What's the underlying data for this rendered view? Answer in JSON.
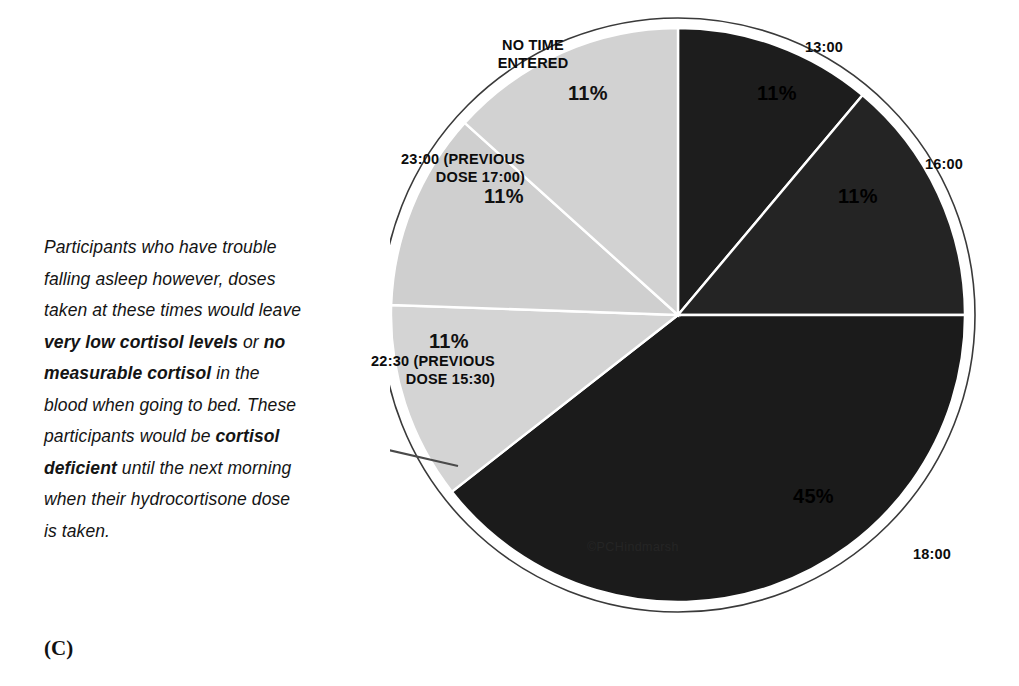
{
  "panel": {
    "label": "(C)",
    "watermark": "©PCHindmarsh"
  },
  "annotation": {
    "segments": [
      {
        "text": "Participants who have trouble falling asleep however, doses taken at these times would leave ",
        "bold": false
      },
      {
        "text": "very low cortisol levels",
        "bold": true
      },
      {
        "text": " or ",
        "bold": false
      },
      {
        "text": "no measurable cortisol",
        "bold": true
      },
      {
        "text": " in the blood when going to bed. These participants would be ",
        "bold": false
      },
      {
        "text": "cortisol deficient",
        "bold": true
      },
      {
        "text": " until the next morning when their hydrocortisone dose is taken.",
        "bold": false
      }
    ]
  },
  "chart_data": {
    "type": "pie",
    "title": "",
    "legend_position": "labels-around-slices",
    "start_angle_deg": 0,
    "direction": "clockwise",
    "categories": [
      "13:00",
      "16:00",
      "18:00",
      "22:30 (PREVIOUS DOSE 15:30)",
      "23:00 (PREVIOUS DOSE 17:00)",
      "NO TIME ENTERED"
    ],
    "values": [
      11,
      11,
      45,
      11,
      11,
      11
    ],
    "value_labels": [
      "11%",
      "11%",
      "45%",
      "11%",
      "11%",
      "11%"
    ],
    "colors": [
      "#1d1d1d",
      "#242424",
      "#1b1b1b",
      "#d4d4d4",
      "#cfcfcf",
      "#d2d2d2"
    ],
    "slices": [
      {
        "name": "13:00",
        "value": 11,
        "value_label": "11%",
        "color": "#1d1d1d",
        "label_text": "13:00",
        "start_deg": 0,
        "end_deg": 40
      },
      {
        "name": "16:00",
        "value": 11,
        "value_label": "11%",
        "color": "#242424",
        "label_text": "16:00",
        "start_deg": 40,
        "end_deg": 90
      },
      {
        "name": "18:00",
        "value": 45,
        "value_label": "45%",
        "color": "#1b1b1b",
        "label_text": "18:00",
        "start_deg": 90,
        "end_deg": 232
      },
      {
        "name": "22:30",
        "value": 11,
        "value_label": "11%",
        "color": "#d4d4d4",
        "label_text": "22:30 (PREVIOUS\nDOSE 15:30)",
        "start_deg": 232,
        "end_deg": 272
      },
      {
        "name": "23:00",
        "value": 11,
        "value_label": "11%",
        "color": "#cfcfcf",
        "label_text": "23:00 (PREVIOUS\nDOSE 17:00)",
        "start_deg": 272,
        "end_deg": 312
      },
      {
        "name": "NO TIME ENTERED",
        "value": 11,
        "value_label": "11%",
        "color": "#d2d2d2",
        "label_text": "NO TIME\nENTERED",
        "start_deg": 312,
        "end_deg": 360
      }
    ]
  },
  "colors": {
    "dark_slice": "#1d1d1d",
    "light_slice": "#d2d2d2",
    "outline": "#3a3a3a",
    "text": "#0c0c0c",
    "background": "#ffffff"
  }
}
